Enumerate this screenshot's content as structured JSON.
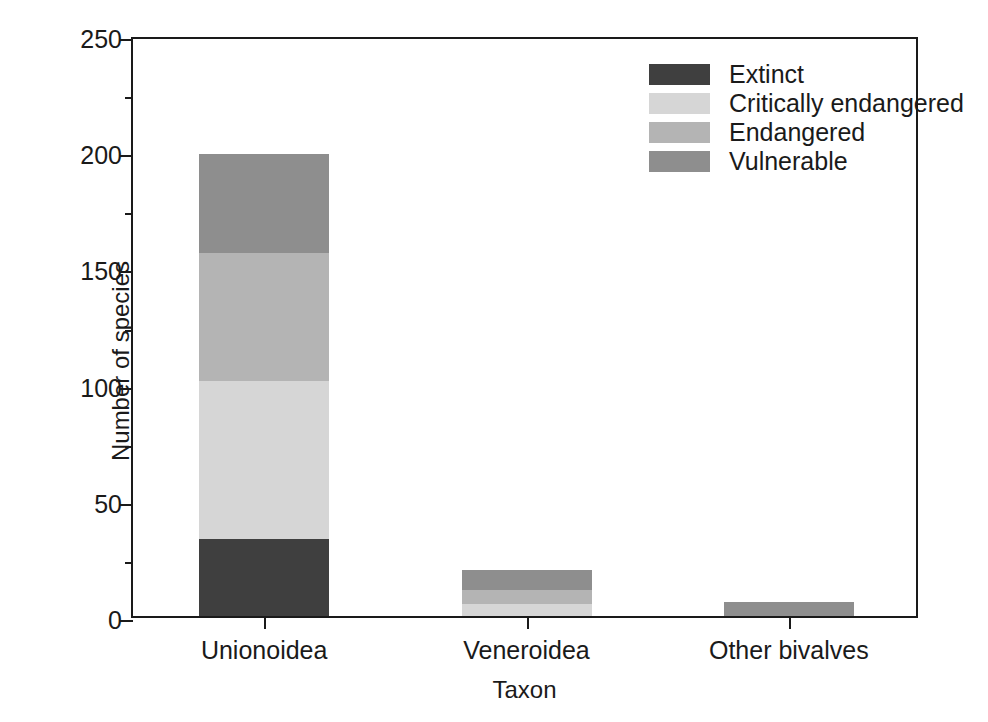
{
  "chart_data": {
    "type": "bar",
    "subtype": "stacked-bar",
    "title": "",
    "xlabel": "Taxon",
    "ylabel": "Number of species",
    "categories": [
      "Unionoidea",
      "Veneroidea",
      "Other bivalves"
    ],
    "series": [
      {
        "name": "Extinct",
        "values": [
          33,
          0,
          0
        ],
        "color": "#3f3f3f"
      },
      {
        "name": "Critically endangered",
        "values": [
          68,
          5,
          0
        ],
        "color": "#d6d6d6"
      },
      {
        "name": "Endangered",
        "values": [
          55,
          6,
          0
        ],
        "color": "#b4b4b4"
      },
      {
        "name": "Vulnerable",
        "values": [
          43,
          9,
          6
        ],
        "color": "#8e8e8e"
      }
    ],
    "totals": [
      199,
      20,
      6
    ],
    "ylim": [
      0,
      250
    ],
    "ytick_labels": [
      "0",
      "50",
      "100",
      "150",
      "200",
      "250"
    ],
    "ytick_values": [
      0,
      50,
      100,
      150,
      200,
      250
    ],
    "yminor_tick_values": [
      25,
      75,
      125,
      175,
      225
    ],
    "grid": false,
    "legend_position": "top-right",
    "stack_order_bottom_to_top": [
      "Extinct",
      "Critically endangered",
      "Endangered",
      "Vulnerable"
    ]
  },
  "axes": {
    "y_title": "Number of species",
    "x_title": "Taxon",
    "y_ticks": [
      {
        "label": "250",
        "value": 250
      },
      {
        "label": "200",
        "value": 200
      },
      {
        "label": "150",
        "value": 150
      },
      {
        "label": "100",
        "value": 100
      },
      {
        "label": "50",
        "value": 50
      },
      {
        "label": "0",
        "value": 0
      }
    ],
    "y_minor_ticks": [
      225,
      175,
      125,
      75,
      25
    ],
    "x_ticks": [
      {
        "label": "Unionoidea"
      },
      {
        "label": "Veneroidea"
      },
      {
        "label": "Other bivalves"
      }
    ]
  },
  "legend": {
    "entries": [
      {
        "label": "Extinct",
        "color": "#3f3f3f"
      },
      {
        "label": "Critically endangered",
        "color": "#d6d6d6"
      },
      {
        "label": "Endangered",
        "color": "#b4b4b4"
      },
      {
        "label": "Vulnerable",
        "color": "#8e8e8e"
      }
    ]
  },
  "colors": {
    "axis": "#1a1a1a",
    "background": "#ffffff",
    "extinct": "#3f3f3f",
    "critically_endangered": "#d6d6d6",
    "endangered": "#b4b4b4",
    "vulnerable": "#8e8e8e"
  }
}
